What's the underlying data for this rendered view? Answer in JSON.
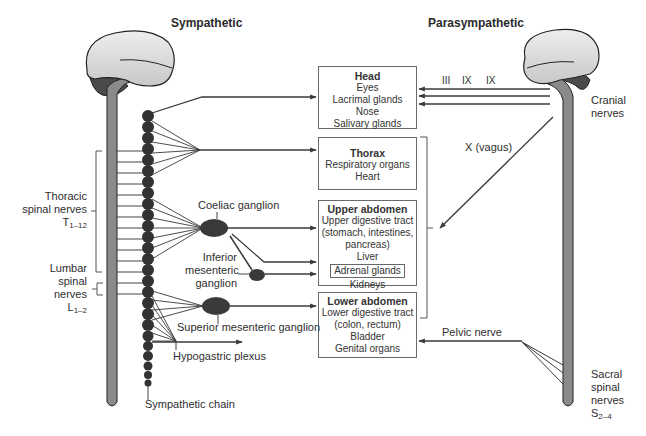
{
  "titles": {
    "sympathetic": "Sympathetic",
    "parasympathetic": "Parasympathetic"
  },
  "boxes": {
    "head": {
      "title": "Head",
      "items": [
        "Eyes",
        "Lacrimal glands",
        "Nose",
        "Salivary glands"
      ]
    },
    "thorax": {
      "title": "Thorax",
      "items": [
        "Respiratory organs",
        "Heart"
      ]
    },
    "upper_abdomen": {
      "title": "Upper abdomen",
      "items": [
        "Upper digestive tract",
        "(stomach, intestines,",
        "pancreas)",
        "Liver",
        "Adrenal glands",
        "Kidneys"
      ]
    },
    "lower_abdomen": {
      "title": "Lower abdomen",
      "items": [
        "Lower digestive tract",
        "(colon, rectum)",
        "Bladder",
        "Genital organs"
      ]
    }
  },
  "left_labels": {
    "thoracic_line1": "Thoracic",
    "thoracic_line2": "spinal nerves",
    "thoracic_sym": "T",
    "thoracic_sub": "1–12",
    "lumbar_line1": "Lumbar",
    "lumbar_line2": "spinal",
    "lumbar_line3": "nerves",
    "lumbar_sym": "L",
    "lumbar_sub": "1–2"
  },
  "ganglia_labels": {
    "coeliac": "Coeliac ganglion",
    "inferior_line1": "Inferior",
    "inferior_line2": "mesenteric",
    "inferior_line3": "ganglion",
    "superior": "Superior mesenteric ganglion",
    "hypogastric": "Hypogastric plexus",
    "chain": "Sympathetic chain"
  },
  "right_labels": {
    "cn_III": "III",
    "cn_IX_a": "IX",
    "cn_IX_b": "IX",
    "cranial_line1": "Cranial",
    "cranial_line2": "nerves",
    "vagus": "X (vagus)",
    "pelvic": "Pelvic nerve",
    "sacral_line1": "Sacral",
    "sacral_line2": "spinal",
    "sacral_line3": "nerves",
    "sacral_sym": "S",
    "sacral_sub": "2–4"
  },
  "colors": {
    "brain_light": "#dcdcdc",
    "brain_dark": "#4a4a4a",
    "cord": "#8a8a8a",
    "chain": "#333333",
    "line": "#3a3a3a",
    "box_border": "#6a6a6a"
  }
}
